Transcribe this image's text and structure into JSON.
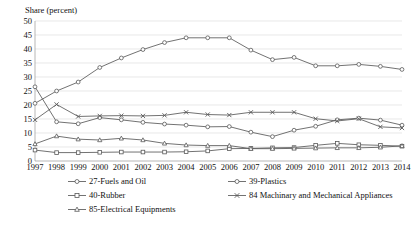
{
  "chart_data": {
    "type": "line",
    "title": "",
    "ylabel": "Share (percent)",
    "xlabel": "",
    "ylim": [
      0,
      50
    ],
    "ytick_step": 5,
    "yticks": [
      "0",
      "5",
      "10",
      "15",
      "20",
      "25",
      "30",
      "35",
      "40",
      "45",
      "50"
    ],
    "grid": true,
    "legend_position": "bottom",
    "x": [
      1997,
      1998,
      1999,
      2000,
      2001,
      2002,
      2003,
      2004,
      2005,
      2006,
      2007,
      2008,
      2009,
      2010,
      2011,
      2012,
      2013,
      2014
    ],
    "categories": [
      "1997",
      "1998",
      "1999",
      "2000",
      "2001",
      "2002",
      "2003",
      "2004",
      "2005",
      "2006",
      "2007",
      "2008",
      "2009",
      "2010",
      "2011",
      "2012",
      "2013",
      "2014"
    ],
    "series": [
      {
        "name": "27-Fuels and Oil",
        "marker": "circle",
        "values": [
          26.5,
          14.0,
          13.3,
          15.5,
          14.7,
          13.8,
          13.2,
          12.8,
          12.2,
          12.3,
          10.3,
          8.7,
          11.0,
          12.4,
          14.7,
          15.3,
          14.6,
          12.8
        ]
      },
      {
        "name": "39-Plastics",
        "marker": "circle",
        "values": [
          20.6,
          25.0,
          28.2,
          33.4,
          36.8,
          39.8,
          42.3,
          44.0,
          44.0,
          44.0,
          39.6,
          36.2,
          37.0,
          34.0,
          34.0,
          34.5,
          33.8,
          32.7
        ]
      },
      {
        "name": "40-Rubber",
        "marker": "square",
        "values": [
          3.9,
          3.0,
          3.0,
          3.1,
          3.2,
          3.2,
          3.2,
          3.3,
          3.6,
          4.4,
          4.5,
          4.7,
          4.8,
          5.6,
          6.3,
          5.8,
          5.6,
          5.3
        ]
      },
      {
        "name": "84 Machinary and Mechanical Appliances",
        "marker": "x",
        "values": [
          14.7,
          20.2,
          15.9,
          16.1,
          16.2,
          16.1,
          16.3,
          17.4,
          16.6,
          16.4,
          17.4,
          17.4,
          17.4,
          15.1,
          14.3,
          15.1,
          12.2,
          11.8
        ]
      },
      {
        "name": "85-Electrical Equipments",
        "marker": "triangle",
        "values": [
          6.1,
          8.9,
          7.8,
          7.5,
          8.1,
          7.5,
          6.3,
          5.7,
          5.5,
          5.5,
          4.4,
          4.4,
          4.5,
          4.6,
          4.7,
          4.7,
          4.9,
          5.4
        ]
      }
    ]
  },
  "axes": {
    "y_title": "Share (percent)"
  },
  "legend": {
    "items": [
      {
        "label": "27-Fuels and Oil",
        "marker": "circle"
      },
      {
        "label": "39-Plastics",
        "marker": "circle"
      },
      {
        "label": "40-Rubber",
        "marker": "square"
      },
      {
        "label": "84 Machinary and Mechanical Appliances",
        "marker": "x"
      },
      {
        "label": "85-Electrical Equipments",
        "marker": "triangle"
      }
    ]
  },
  "colors": {
    "line": "#595959",
    "grid": "#d9d9d9",
    "axis": "#9a9a9a",
    "text": "#111111",
    "background": "#ffffff"
  }
}
